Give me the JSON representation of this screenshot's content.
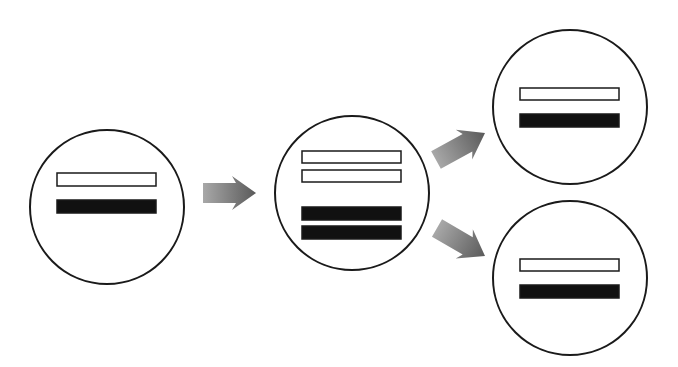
{
  "diagram": {
    "title": "",
    "colors": {
      "background": "#ffffff",
      "outline": "#1a1a1a",
      "light_bar_fill": "#ffffff",
      "dark_bar_fill": "#111111",
      "arrow_light": "#a8a8a8",
      "arrow_dark": "#5a5a5a"
    },
    "nodes": [
      {
        "id": "parent-cell",
        "shape": "circle",
        "center": [
          107,
          207
        ],
        "radius": 77,
        "bars": [
          {
            "type": "light",
            "x": 57,
            "y": 173,
            "w": 99,
            "h": 13
          },
          {
            "type": "dark",
            "x": 57,
            "y": 200,
            "w": 99,
            "h": 13
          }
        ]
      },
      {
        "id": "replicated-cell",
        "shape": "circle",
        "center": [
          352,
          193
        ],
        "radius": 77,
        "bars": [
          {
            "type": "light",
            "x": 302,
            "y": 151,
            "w": 99,
            "h": 12
          },
          {
            "type": "light",
            "x": 302,
            "y": 170,
            "w": 99,
            "h": 12
          },
          {
            "type": "dark",
            "x": 302,
            "y": 207,
            "w": 99,
            "h": 13
          },
          {
            "type": "dark",
            "x": 302,
            "y": 226,
            "w": 99,
            "h": 13
          }
        ]
      },
      {
        "id": "daughter-cell-top",
        "shape": "circle",
        "center": [
          570,
          107
        ],
        "radius": 77,
        "bars": [
          {
            "type": "light",
            "x": 520,
            "y": 88,
            "w": 99,
            "h": 12
          },
          {
            "type": "dark",
            "x": 520,
            "y": 114,
            "w": 99,
            "h": 13
          }
        ]
      },
      {
        "id": "daughter-cell-bottom",
        "shape": "circle",
        "center": [
          570,
          278
        ],
        "radius": 77,
        "bars": [
          {
            "type": "light",
            "x": 520,
            "y": 259,
            "w": 99,
            "h": 12
          },
          {
            "type": "dark",
            "x": 520,
            "y": 285,
            "w": 99,
            "h": 13
          }
        ]
      }
    ],
    "edges": [
      {
        "from": "parent-cell",
        "to": "replicated-cell",
        "start": [
          203,
          193
        ],
        "end": [
          256,
          193
        ]
      },
      {
        "from": "replicated-cell",
        "to": "daughter-cell-top",
        "start": [
          436,
          160
        ],
        "end": [
          485,
          133
        ]
      },
      {
        "from": "replicated-cell",
        "to": "daughter-cell-bottom",
        "start": [
          437,
          228
        ],
        "end": [
          485,
          256
        ]
      }
    ]
  }
}
